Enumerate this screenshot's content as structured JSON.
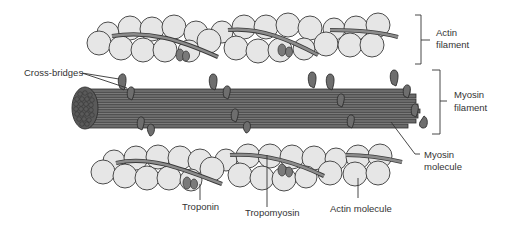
{
  "diagram": {
    "labels": {
      "actin_filament": [
        "Actin",
        "filament"
      ],
      "myosin_filament": [
        "Myosin",
        "filament"
      ],
      "myosin_molecule": [
        "Myosin",
        "molecule"
      ],
      "cross_bridges": "Cross-bridges",
      "troponin": "Troponin",
      "tropomyosin": "Tropomyosin",
      "actin_molecule": "Actin molecule"
    },
    "colors": {
      "actin_bead_fill": "#e6e6e6",
      "outline": "#3a3a3a",
      "myosin_fill": "#6a6a6a",
      "troponin_fill": "#7a7a7a",
      "background": "#ffffff"
    },
    "components": [
      {
        "id": "top-actin-filament",
        "type": "actin filament",
        "position": "top"
      },
      {
        "id": "myosin-thick-filament",
        "type": "myosin filament",
        "position": "middle"
      },
      {
        "id": "bottom-actin-filament",
        "type": "actin filament",
        "position": "bottom"
      }
    ]
  }
}
